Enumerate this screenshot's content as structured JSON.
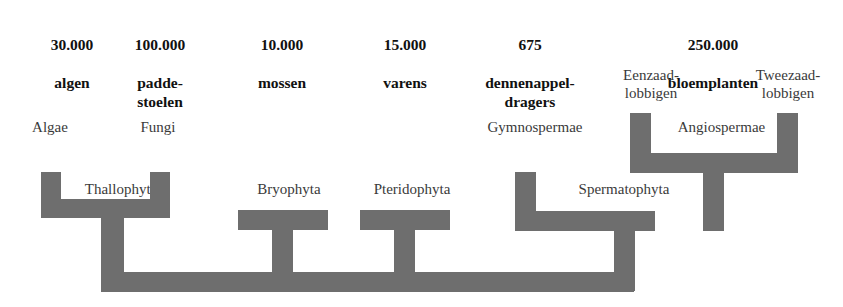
{
  "diagram": {
    "branch_color": "#6e6e6e",
    "background_color": "#ffffff",
    "columns": [
      {
        "id": "algen",
        "count": "30.000",
        "name": "algen"
      },
      {
        "id": "paddestoelen",
        "count": "100.000",
        "name": "padde-\nstoelen"
      },
      {
        "id": "mossen",
        "count": "10.000",
        "name": "mossen"
      },
      {
        "id": "varens",
        "count": "15.000",
        "name": "varens"
      },
      {
        "id": "dennenappeldragers",
        "count": "675",
        "name": "dennenappel-\ndragers"
      },
      {
        "id": "bloemplanten",
        "count": "250.000",
        "name": "bloemplanten"
      }
    ],
    "taxa": {
      "algae": "Algae",
      "fungi": "Fungi",
      "thallophyta": "Thallophyta",
      "bryophyta": "Bryophyta",
      "pteridophyta": "Pteridophyta",
      "gymnospermae": "Gymnospermae",
      "spermatophyta": "Spermatophyta",
      "angiospermae": "Angiospermae",
      "eenzaadlobbigen": "Eenzaad-\nlobbigen",
      "tweezaadlobbigen": "Tweezaad-\nlobbigen"
    }
  }
}
